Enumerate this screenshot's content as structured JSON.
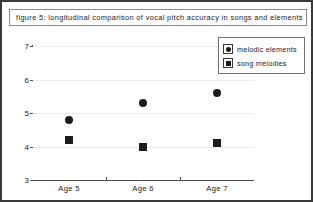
{
  "figure": {
    "title": "figure 5: longitudinal comparison of vocal pitch accuracy in songs and elements"
  },
  "legend": {
    "items": [
      {
        "label": "melodic elements",
        "marker": "circle-marker-icon"
      },
      {
        "label": "song melodies",
        "marker": "square-marker-icon"
      }
    ]
  },
  "chart_data": {
    "type": "scatter",
    "title": "figure 5: longitudinal comparison of vocal pitch accuracy in songs and elements",
    "xlabel": "",
    "ylabel": "",
    "categories": [
      "Age 5",
      "Age 6",
      "Age 7"
    ],
    "ylim": [
      3,
      7
    ],
    "yticks": [
      3,
      4,
      5,
      6,
      7
    ],
    "grid": true,
    "legend_position": "top-right",
    "series": [
      {
        "name": "melodic elements",
        "marker": "circle",
        "color": "#1c1c1c",
        "values": [
          4.8,
          5.3,
          5.6
        ]
      },
      {
        "name": "song melodies",
        "marker": "square",
        "color": "#1c1c1c",
        "values": [
          4.2,
          4.0,
          4.1
        ]
      }
    ]
  }
}
